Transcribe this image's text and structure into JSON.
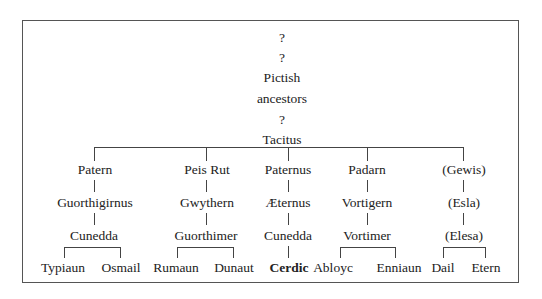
{
  "diagram": {
    "type": "genealogy-tree",
    "ancestry": [
      {
        "label": "?",
        "x": 282,
        "y": 38
      },
      {
        "label": "?",
        "x": 282,
        "y": 58
      },
      {
        "label": "Pictish",
        "x": 282,
        "y": 78
      },
      {
        "label": "ancestors",
        "x": 282,
        "y": 99
      },
      {
        "label": "?",
        "x": 282,
        "y": 120
      },
      {
        "label": "Tacitus",
        "x": 282,
        "y": 140
      }
    ],
    "branches": [
      {
        "gen1": "Patern",
        "gen2": "Guorthigirnus",
        "gen3": "Cunedda",
        "children": [
          "Typiaun",
          "Osmail"
        ]
      },
      {
        "gen1": "Peis Rut",
        "gen2": "Gwythern",
        "gen3": "Guorthimer",
        "children": [
          "Rumaun",
          "Dunaut"
        ]
      },
      {
        "gen1": "Paternus",
        "gen2": "Æternus",
        "gen3": "Cunedda",
        "children": [
          "Cerdic"
        ]
      },
      {
        "gen1": "Padarn",
        "gen2": "Vortigern",
        "gen3": "Vortimer",
        "children": [
          "Abloyc",
          "Enniaun"
        ]
      },
      {
        "gen1": "(Gewis)",
        "gen2": "(Esla)",
        "gen3": "(Elesa)",
        "children": [
          "Dail",
          "Etern"
        ]
      }
    ],
    "emphasized": "Cerdic"
  }
}
